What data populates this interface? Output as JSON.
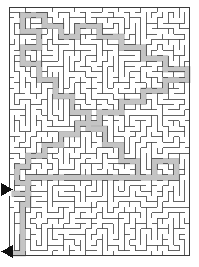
{
  "puzzle": {
    "type": "maze",
    "title": "Rectangular maze with solution path",
    "grid_cols": 33,
    "grid_rows": 46,
    "cell_size_px": 5.2,
    "frame": {
      "x": 9,
      "y": 7,
      "width": 181,
      "height": 249,
      "border_px": 1.4
    },
    "colors": {
      "background": "#ffffff",
      "wall": "#4a4a4a",
      "frame": "#3a3a3a",
      "solution_path": "#c4c4c4",
      "solution_path_edge": "#9a9a9a",
      "arrow": "#111111"
    },
    "markers": [
      {
        "name": "entrance-arrow",
        "label": "Entrance",
        "direction": "right",
        "x": 1,
        "y": 183,
        "width": 12,
        "height": 13
      },
      {
        "name": "exit-arrow",
        "label": "Exit",
        "direction": "left",
        "x": 1,
        "y": 245,
        "width": 12,
        "height": 13
      }
    ],
    "entrance": {
      "side": "left",
      "row": 34
    },
    "exit": {
      "side": "left",
      "row": 46
    },
    "solution_waypoints_cells": [
      [
        0,
        34
      ],
      [
        3,
        34
      ],
      [
        3,
        32
      ],
      [
        1,
        32
      ],
      [
        1,
        29
      ],
      [
        3,
        29
      ],
      [
        3,
        27
      ],
      [
        6,
        27
      ],
      [
        6,
        25
      ],
      [
        9,
        25
      ],
      [
        9,
        23
      ],
      [
        12,
        23
      ],
      [
        12,
        21
      ],
      [
        16,
        21
      ],
      [
        16,
        19
      ],
      [
        20,
        19
      ],
      [
        20,
        17
      ],
      [
        24,
        17
      ],
      [
        24,
        15
      ],
      [
        28,
        15
      ],
      [
        28,
        13
      ],
      [
        32,
        13
      ],
      [
        32,
        11
      ],
      [
        28,
        11
      ],
      [
        28,
        9
      ],
      [
        24,
        9
      ],
      [
        24,
        7
      ],
      [
        20,
        7
      ],
      [
        20,
        5
      ],
      [
        16,
        5
      ],
      [
        16,
        3
      ],
      [
        12,
        3
      ],
      [
        12,
        5
      ],
      [
        9,
        5
      ],
      [
        9,
        3
      ],
      [
        6,
        3
      ],
      [
        6,
        1
      ],
      [
        2,
        1
      ],
      [
        2,
        4
      ],
      [
        5,
        4
      ],
      [
        5,
        7
      ],
      [
        2,
        7
      ],
      [
        2,
        10
      ],
      [
        5,
        10
      ],
      [
        5,
        13
      ],
      [
        8,
        13
      ],
      [
        8,
        16
      ],
      [
        11,
        16
      ],
      [
        11,
        19
      ],
      [
        14,
        19
      ],
      [
        14,
        22
      ],
      [
        17,
        22
      ],
      [
        17,
        25
      ],
      [
        20,
        25
      ],
      [
        20,
        28
      ],
      [
        23,
        28
      ],
      [
        23,
        31
      ],
      [
        26,
        31
      ],
      [
        26,
        28
      ],
      [
        30,
        28
      ],
      [
        30,
        31
      ],
      [
        26,
        31
      ],
      [
        22,
        31
      ],
      [
        18,
        31
      ],
      [
        14,
        31
      ],
      [
        10,
        31
      ],
      [
        6,
        31
      ],
      [
        3,
        31
      ],
      [
        3,
        36
      ],
      [
        2,
        36
      ],
      [
        2,
        40
      ],
      [
        2,
        46
      ],
      [
        0,
        46
      ]
    ]
  },
  "annotations": {
    "entrance_label": "Entrance",
    "exit_label": "Exit",
    "path_label": "Solution path"
  }
}
